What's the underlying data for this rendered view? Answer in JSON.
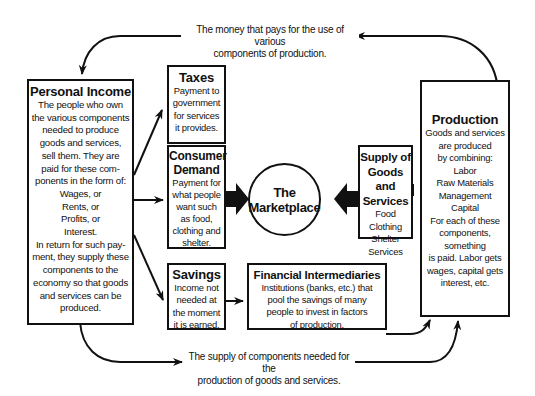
{
  "diagram": {
    "top_caption": "The money that pays for the use of various\ncomponents of production.",
    "bottom_caption": "The supply of components needed for the\nproduction of goods and services.",
    "personal_income": {
      "title": "Personal Income",
      "body": "The people who own\nthe various components\nneeded to produce\ngoods and services,\nsell them. They are\npaid for these com-\nponents in the form of:\nWages, or\nRents, or\nProfits, or\nInterest.\nIn return for such pay-\nment, they supply these\ncomponents to the\neconomy so that goods\nand services can be\nproduced."
    },
    "taxes": {
      "title": "Taxes",
      "body": "Payment to\ngovernment\nfor services\nit provides."
    },
    "consumer_demand": {
      "title": "Consumer\nDemand",
      "body": "Payment for\nwhat people\nwant such\nas food,\nclothing and\nshelter."
    },
    "savings": {
      "title": "Savings",
      "body": "Income not\nneeded at\nthe moment\nit is earned."
    },
    "marketplace": {
      "label": "The\nMarketplace"
    },
    "supply": {
      "title": "Supply of\nGoods and\nServices",
      "body": "Food\nClothing\nShelter\nServices"
    },
    "financial_intermediaries": {
      "title": "Financial Intermediaries",
      "body": "Institutions (banks, etc.) that\npool the savings of many\npeople to invest in factors\nof production."
    },
    "production": {
      "title": "Production",
      "body": "Goods and services\nare produced\nby combining:\nLabor\nRaw Materials\nManagement\nCapital\nFor each of these\ncomponents,\nsomething\nis paid. Labor gets\nwages, capital gets\ninterest, etc."
    }
  }
}
